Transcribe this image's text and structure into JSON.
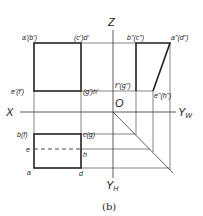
{
  "caption": "(b)",
  "axes": {
    "z": "Z",
    "x": "X",
    "yw": "YW",
    "yw_main": "Y",
    "yw_sub": "W",
    "yh_main": "Y",
    "yh_sub": "H",
    "origin": "O"
  },
  "front_view": {
    "top_left": "a'(b')",
    "top_right": "(c')d'",
    "bottom_left": "e'(f')",
    "bottom_right": "(g')h'"
  },
  "side_view": {
    "top_left": "b\"(c\")",
    "top_right": "a\"(d\")",
    "bottom_left": "f\"(g\")",
    "bottom_right": "e\"(h\")"
  },
  "top_view": {
    "top_left": "b(f)",
    "top_right": "c(g)",
    "mid_left": "e",
    "mid_right": "h",
    "bottom_left": "a",
    "bottom_right": "d"
  },
  "colors": {
    "line": "#222222",
    "thin": "#333333",
    "background": "#ffffff"
  }
}
